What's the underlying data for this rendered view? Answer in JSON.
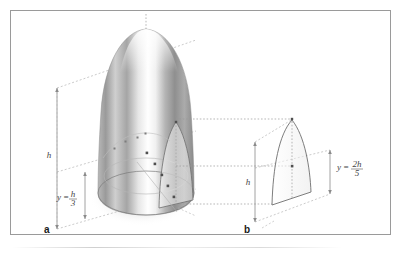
{
  "figure": {
    "background_color": "#ffffff",
    "frame_color": "#9a9a9a",
    "panels": [
      {
        "id": "a",
        "letter": "a",
        "type": "3d-solid-paraboloid",
        "labels": [
          {
            "name": "total-height",
            "text_parts": {
              "lhs": "h"
            },
            "display": "h"
          },
          {
            "name": "partial-height",
            "text_parts": {
              "lhs": "y",
              "eq": "=",
              "num": "h",
              "den": "3"
            },
            "display": "y = h/3"
          }
        ]
      },
      {
        "id": "b",
        "letter": "b",
        "type": "2d-parabolic-cross-section",
        "labels": [
          {
            "name": "total-height",
            "text_parts": {
              "lhs": "h"
            },
            "display": "h"
          },
          {
            "name": "partial-height",
            "text_parts": {
              "lhs": "y",
              "eq": "=",
              "num": "2h",
              "den": "5"
            },
            "display": "y = 2h/5"
          }
        ]
      }
    ]
  },
  "labels": {
    "panel_a_letter": "a",
    "panel_b_letter": "b",
    "h_symbol": "h",
    "y_symbol": "y",
    "equals": "=",
    "frac_a_numerator": "h",
    "frac_a_denominator": "3",
    "frac_b_numerator": "2h",
    "frac_b_denominator": "5"
  },
  "colors": {
    "frame": "#9a9a9a",
    "outline": "#6e6e6e",
    "guide_dotted": "#9a9a9a",
    "guide_dashed": "#a8a8a8",
    "marker": "#555555",
    "text": "#333333",
    "surface_light": "#fdfdfd",
    "surface_mid": "#c9c9c9",
    "surface_dark": "#8d8d8d",
    "shadow": "#d9d9d9"
  }
}
